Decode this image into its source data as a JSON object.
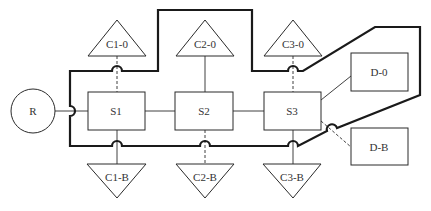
{
  "diagram": {
    "nodes": {
      "R": {
        "label": "R",
        "shape": "circle"
      },
      "S1": {
        "label": "S1",
        "shape": "rectangle"
      },
      "S2": {
        "label": "S2",
        "shape": "rectangle"
      },
      "S3": {
        "label": "S3",
        "shape": "rectangle"
      },
      "C1_0": {
        "label": "C1-0",
        "shape": "triangle-up"
      },
      "C2_0": {
        "label": "C2-0",
        "shape": "triangle-up"
      },
      "C3_0": {
        "label": "C3-0",
        "shape": "triangle-up"
      },
      "C1_B": {
        "label": "C1-B",
        "shape": "triangle-down"
      },
      "C2_B": {
        "label": "C2-B",
        "shape": "triangle-down"
      },
      "C3_B": {
        "label": "C3-B",
        "shape": "triangle-down"
      },
      "D_0": {
        "label": "D-0",
        "shape": "rectangle"
      },
      "D_B": {
        "label": "D-B",
        "shape": "rectangle"
      }
    },
    "edges": [
      {
        "from": "R",
        "to": "S1",
        "style": "solid"
      },
      {
        "from": "S1",
        "to": "S2",
        "style": "solid"
      },
      {
        "from": "S2",
        "to": "S3",
        "style": "solid"
      },
      {
        "from": "S1",
        "to": "C1-0",
        "style": "dashed"
      },
      {
        "from": "S2",
        "to": "C2-0",
        "style": "solid"
      },
      {
        "from": "S3",
        "to": "C3-0",
        "style": "dashed"
      },
      {
        "from": "S1",
        "to": "C1-B",
        "style": "solid"
      },
      {
        "from": "S2",
        "to": "C2-B",
        "style": "dashed"
      },
      {
        "from": "S3",
        "to": "C3-B",
        "style": "solid"
      },
      {
        "from": "S3",
        "to": "D-0",
        "style": "solid"
      },
      {
        "from": "S3",
        "to": "D-B",
        "style": "dashed"
      }
    ],
    "boundary": {
      "style": "thick",
      "description": "enclosing boundary around S1, S2, S3, C2-0 and D-0"
    }
  }
}
